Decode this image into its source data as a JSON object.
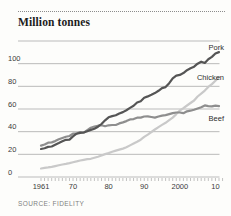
{
  "chart": {
    "title": "Million tonnes",
    "source": "SOURCE: FIDELITY",
    "background": "#fdfdfb"
  },
  "chart_data": {
    "type": "line",
    "title": "Million tonnes",
    "ylabel": "Million tonnes",
    "xlabel": "",
    "ylim": [
      0,
      120
    ],
    "ytick_step": 20,
    "yticks_labeled": [
      0,
      20,
      40,
      60,
      80,
      100
    ],
    "grid": "horizontal",
    "legend": "end-of-line-labels",
    "source": "SOURCE: FIDELITY",
    "years": [
      1961,
      1962,
      1963,
      1964,
      1965,
      1966,
      1967,
      1968,
      1969,
      1970,
      1971,
      1972,
      1973,
      1974,
      1975,
      1976,
      1977,
      1978,
      1979,
      1980,
      1981,
      1982,
      1983,
      1984,
      1985,
      1986,
      1987,
      1988,
      1989,
      1990,
      1991,
      1992,
      1993,
      1994,
      1995,
      1996,
      1997,
      1998,
      1999,
      2000,
      2001,
      2002,
      2003,
      2004,
      2005,
      2006,
      2007,
      2008,
      2009,
      2010,
      2011
    ],
    "xticks": [
      {
        "value": 1961,
        "label": "1961"
      },
      {
        "value": 1970,
        "label": "70"
      },
      {
        "value": 1980,
        "label": "80"
      },
      {
        "value": 1990,
        "label": "90"
      },
      {
        "value": 2000,
        "label": "2000"
      },
      {
        "value": 2010,
        "label": "10"
      }
    ],
    "series": [
      {
        "name": "Chicken",
        "color": "#c9c9c9",
        "label_dy": 3,
        "values": [
          7.5,
          8.0,
          8.5,
          9.0,
          9.6,
          10.3,
          11.0,
          11.6,
          12.3,
          13.1,
          13.8,
          14.6,
          15.2,
          15.7,
          16.1,
          17.0,
          17.9,
          19.0,
          20.2,
          21.1,
          22.2,
          23.3,
          24.2,
          25.1,
          26.2,
          27.9,
          29.5,
          31.1,
          32.9,
          35.4,
          37.4,
          39.7,
          41.9,
          44.0,
          46.0,
          47.8,
          50.1,
          52.4,
          55.5,
          58.7,
          60.8,
          63.1,
          65.3,
          67.5,
          71.0,
          73.6,
          76.2,
          79.5,
          82.0,
          85.0,
          88.1
        ]
      },
      {
        "name": "Beef",
        "color": "#8e8e8e",
        "label_dy": 15,
        "values": [
          27.7,
          28.7,
          30.3,
          30.5,
          31.7,
          33.3,
          34.4,
          35.5,
          36.2,
          38.3,
          38.4,
          39.6,
          39.2,
          41.4,
          43.5,
          44.6,
          45.3,
          45.7,
          44.8,
          45.6,
          45.9,
          45.9,
          47.3,
          48.2,
          49.3,
          50.8,
          51.1,
          52.3,
          52.4,
          53.4,
          53.5,
          52.9,
          52.4,
          53.4,
          54.2,
          54.6,
          55.5,
          56.4,
          56.9,
          56.9,
          56.3,
          58.0,
          58.5,
          59.3,
          60.4,
          61.6,
          63.2,
          62.6,
          62.3,
          62.9,
          62.6
        ]
      },
      {
        "name": "Pork",
        "color": "#555555",
        "label_dy": -2,
        "values": [
          24.7,
          25.4,
          26.6,
          26.9,
          28.4,
          29.9,
          31.5,
          32.8,
          33.0,
          35.8,
          38.2,
          38.9,
          39.3,
          40.4,
          41.6,
          42.6,
          44.4,
          46.8,
          50.0,
          52.7,
          53.7,
          54.4,
          56.0,
          57.3,
          58.9,
          61.0,
          62.8,
          65.7,
          66.9,
          69.9,
          71.1,
          72.5,
          74.0,
          76.1,
          78.4,
          79.3,
          82.8,
          87.1,
          89.5,
          90.1,
          91.7,
          94.2,
          95.9,
          97.3,
          100.0,
          101.7,
          100.6,
          103.9,
          106.0,
          109.0,
          110.2
        ]
      }
    ],
    "colors": {
      "grid": "#b3b3b3",
      "tick": "#9a9a9a",
      "axis_text": "#3a3a3a",
      "series_label_text": "#2e2e2e"
    }
  }
}
